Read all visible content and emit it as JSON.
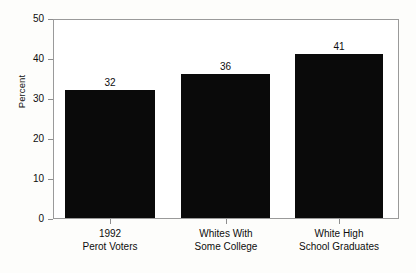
{
  "chart_data": {
    "type": "bar",
    "title": "",
    "xlabel": "",
    "ylabel": "Percent",
    "categories": [
      "1992\nPerot Voters",
      "Whites With\nSome College",
      "White High\nSchool Graduates"
    ],
    "category_lines": [
      [
        "1992",
        "Perot Voters"
      ],
      [
        "Whites With",
        "Some College"
      ],
      [
        "White High",
        "School Graduates"
      ]
    ],
    "values": [
      32,
      36,
      41
    ],
    "value_labels": [
      "32",
      "36",
      "41"
    ],
    "ylim": [
      0,
      50
    ],
    "ytick_values": [
      0,
      10,
      20,
      30,
      40,
      50
    ],
    "ytick_labels": [
      "0",
      "10",
      "20",
      "30",
      "40",
      "50"
    ],
    "grid": false,
    "legend": null,
    "bar_color": "#0a0a0a",
    "frame_color": "#9a9a9a",
    "background": "#ffffff"
  }
}
